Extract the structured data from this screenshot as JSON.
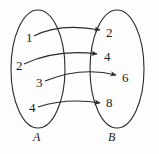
{
  "figure": {
    "type": "mapping-diagram",
    "stroke_color": "#2a2a2a",
    "text_color": "#1b1b1b",
    "background_color": "#fdfdfd"
  },
  "sets": {
    "domain": {
      "label": "A",
      "label_x": 33,
      "label_y": 131,
      "oval": {
        "cx": 38,
        "cy": 69,
        "rx": 27,
        "ry": 59
      },
      "elements": [
        {
          "value": "1",
          "x": 26,
          "y": 31
        },
        {
          "value": "2",
          "x": 16,
          "y": 59
        },
        {
          "value": "3",
          "x": 36,
          "y": 76
        },
        {
          "value": "4",
          "x": 29,
          "y": 101
        }
      ]
    },
    "codomain": {
      "label": "B",
      "label_x": 108,
      "label_y": 131,
      "oval": {
        "cx": 117,
        "cy": 69,
        "rx": 27,
        "ry": 59
      },
      "elements": [
        {
          "value": "2",
          "x": 106,
          "y": 26
        },
        {
          "value": "4",
          "x": 104,
          "y": 50
        },
        {
          "value": "6",
          "x": 122,
          "y": 71
        },
        {
          "value": "8",
          "x": 106,
          "y": 96
        }
      ]
    }
  },
  "arrows": [
    {
      "from": "1",
      "to": "2",
      "path": "M34,36 C55,25 78,26 100,30"
    },
    {
      "from": "2",
      "to": "4",
      "path": "M24,64 C50,52 74,51 97,54"
    },
    {
      "from": "3",
      "to": "6",
      "path": "M45,81 C72,70 96,70 116,75"
    },
    {
      "from": "4",
      "to": "8",
      "path": "M38,107 C60,100 82,100 100,103"
    }
  ]
}
